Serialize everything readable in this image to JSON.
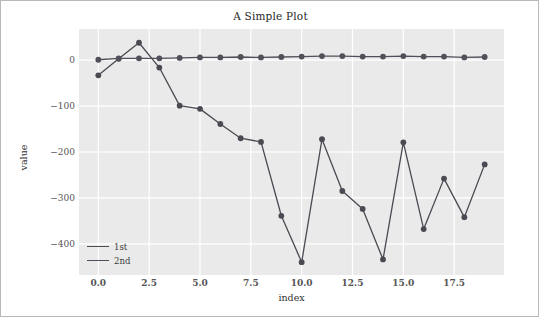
{
  "chart_data": {
    "type": "line",
    "title": "A Simple Plot",
    "xlabel": "index",
    "ylabel": "value",
    "xlim": [
      -0.95,
      19.95
    ],
    "ylim": [
      -468,
      68
    ],
    "xticks": [
      "0.0",
      "2.5",
      "5.0",
      "7.5",
      "10.0",
      "12.5",
      "15.0",
      "17.5"
    ],
    "xtick_values": [
      0.0,
      2.5,
      5.0,
      7.5,
      10.0,
      12.5,
      15.0,
      17.5
    ],
    "yticks": [
      "0",
      "−100",
      "−200",
      "−300",
      "−400"
    ],
    "ytick_values": [
      0,
      -100,
      -200,
      -300,
      -400
    ],
    "grid": true,
    "grid_color": "#ffffff",
    "plot_bg": "#eaeaea",
    "figure_bg": "#ffffff",
    "legend_position": "lower left",
    "x": [
      0,
      1,
      2,
      3,
      4,
      5,
      6,
      7,
      8,
      9,
      10,
      11,
      12,
      13,
      14,
      15,
      16,
      17,
      18,
      19
    ],
    "series": [
      {
        "name": "1st",
        "color": "#4a4a52",
        "marker": "circle",
        "values": [
          -33,
          3,
          38,
          -16,
          -99,
          -106,
          -139,
          -170,
          -178,
          -339,
          -440,
          -172,
          -285,
          -324,
          -434,
          -179,
          -368,
          -258,
          -342,
          -227
        ]
      },
      {
        "name": "2nd",
        "color": "#50505a",
        "marker": "circle",
        "values": [
          1,
          4,
          4,
          4,
          5,
          6,
          6,
          7,
          6,
          7,
          8,
          9,
          9,
          8,
          8,
          9,
          8,
          8,
          6,
          7
        ]
      }
    ]
  }
}
